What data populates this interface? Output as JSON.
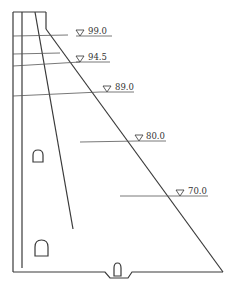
{
  "diagram": {
    "levels": [
      {
        "label": "99.0",
        "text_x": 88,
        "text_y": 35,
        "tri_x": 80,
        "tri_y": 30,
        "underline_x1": 76,
        "underline_x2": 112,
        "underline_y": 36
      },
      {
        "label": "94.5",
        "text_x": 88,
        "text_y": 61,
        "tri_x": 80,
        "tri_y": 56,
        "underline_x1": 76,
        "underline_x2": 110,
        "underline_y": 62
      },
      {
        "label": "89.0",
        "text_x": 115,
        "text_y": 91,
        "tri_x": 107,
        "tri_y": 86,
        "underline_x1": 103,
        "underline_x2": 134,
        "underline_y": 92
      },
      {
        "label": "80.0",
        "text_x": 145,
        "text_y": 140,
        "tri_x": 138,
        "tri_y": 135,
        "underline_x1": 133,
        "underline_x2": 166,
        "underline_y": 141
      },
      {
        "label": "70.0",
        "text_x": 188,
        "text_y": 196,
        "tri_x": 180,
        "tri_y": 191,
        "underline_x1": 176,
        "underline_x2": 208,
        "underline_y": 197
      }
    ],
    "symbol": "▽",
    "stroke_color": "#3a3a3a",
    "background": "#ffffff"
  }
}
